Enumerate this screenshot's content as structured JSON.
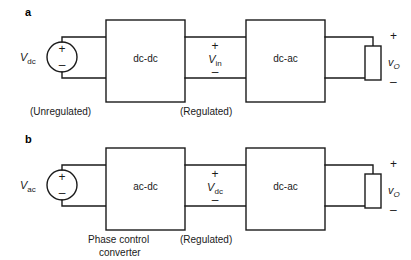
{
  "figure": {
    "background": "#ffffff",
    "line_color": "#1a1a1a"
  },
  "panels": [
    {
      "letter": "a",
      "source": {
        "label_main": "V",
        "label_sub": "dc",
        "plus": "+",
        "minus": "–"
      },
      "caption_left": "(Unregulated)",
      "caption_mid": "(Regulated)",
      "block1": "dc-dc",
      "block2": "dc-ac",
      "mid_voltage": {
        "plus": "+",
        "label_main": "V",
        "label_sub": "in",
        "minus": "–"
      },
      "output": {
        "plus": "+",
        "label_main": "v",
        "label_sub": "O",
        "minus": "–"
      }
    },
    {
      "letter": "b",
      "source": {
        "label_main": "V",
        "label_sub": "ac",
        "plus": "+",
        "minus": "–"
      },
      "caption_left_line1": "Phase control",
      "caption_left_line2": "converter",
      "caption_mid": "(Regulated)",
      "block1": "ac-dc",
      "block2": "dc-ac",
      "mid_voltage": {
        "plus": "+",
        "label_main": "V",
        "label_sub": "dc",
        "minus": "–"
      },
      "output": {
        "plus": "+",
        "label_main": "v",
        "label_sub": "O",
        "minus": "–"
      }
    }
  ]
}
